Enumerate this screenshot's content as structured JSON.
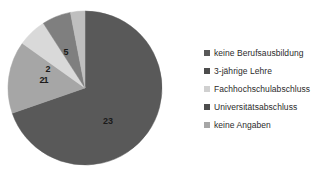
{
  "chart_data": {
    "type": "pie",
    "title": "",
    "subtitle": "",
    "xlabel": "",
    "ylabel": "",
    "total": 33,
    "grid": false,
    "legend_position": "right",
    "data_labels_shown": true,
    "categories": [
      "keine Berufsausbildung",
      "3-jährige Lehre",
      "Fachhochschulabschluss",
      "Universitätsabschluss",
      "keine Angaben"
    ],
    "values": [
      23,
      5,
      2,
      2,
      1
    ],
    "slice_colors": [
      "#595959",
      "#a6a6a6",
      "#d9d9d9",
      "#7f7f7f",
      "#bfbfbf"
    ],
    "slices": [
      {
        "label": "keine Berufsausbildung",
        "value": 23,
        "value_text": "23",
        "color": "#595959",
        "label_x": 108,
        "label_y": 122
      },
      {
        "label": "3-jährige Lehre",
        "value": 5,
        "value_text": "5",
        "color": "#a6a6a6",
        "label_x": 66,
        "label_y": 53
      },
      {
        "label": "Fachhochschulabschluss",
        "value": 2,
        "value_text": "2",
        "color": "#d9d9d9",
        "label_x": 42,
        "label_y": 81
      },
      {
        "label": "Universitätsabschluss",
        "value": 2,
        "value_text": "2",
        "color": "#7f7f7f",
        "label_x": 48,
        "label_y": 70
      },
      {
        "label": "keine Angaben",
        "value": 1,
        "value_text": "1",
        "color": "#bfbfbf",
        "label_x": 46,
        "label_y": 81
      }
    ],
    "geometry": {
      "center_x": 85,
      "center_y": 88,
      "radius": 77,
      "start_angle_deg": -90
    }
  },
  "legend": {
    "items": [
      {
        "label": "keine Berufsausbildung",
        "color": "#595959"
      },
      {
        "label": "3-jährige Lehre",
        "color": "#4d4d4d"
      },
      {
        "label": "Fachhochschulabschluss",
        "color": "#d0d0d0"
      },
      {
        "label": "Universitätsabschluss",
        "color": "#4d4d4d"
      },
      {
        "label": "keine Angaben",
        "color": "#a6a6a6"
      }
    ]
  }
}
